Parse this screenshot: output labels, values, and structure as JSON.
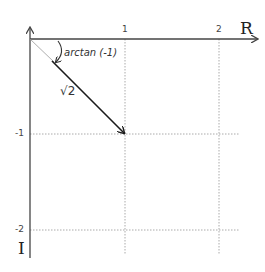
{
  "diagram": {
    "title": "",
    "axes": {
      "x_label": "R",
      "y_label": "I",
      "x_ticks": [
        "1",
        "2"
      ],
      "y_ticks": [
        "-1",
        "-2"
      ]
    },
    "vector": {
      "from": [
        0,
        0
      ],
      "to": [
        1,
        -1
      ],
      "magnitude_label": "√2"
    },
    "angle": {
      "label": "arctan (-1)"
    },
    "colors": {
      "axis": "#444444",
      "grid": "#aaaaaa",
      "vector": "#1a1a1a",
      "background": "#ffffff"
    }
  }
}
